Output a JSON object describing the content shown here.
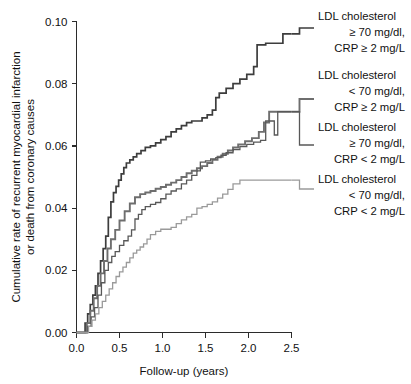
{
  "chart_data": {
    "type": "line",
    "title": "",
    "xlabel": "Follow-up (years)",
    "ylabel": "Cumulative rate of recurrent myocardial infarction or death from coronary causes",
    "ylabel_line1": "Cumulative rate of recurrent myocardial infarction",
    "ylabel_line2": "or death from coronary causes",
    "xlim": [
      0.0,
      2.5
    ],
    "ylim": [
      0.0,
      0.1
    ],
    "xticks": [
      "0.0",
      "0.5",
      "1.0",
      "1.5",
      "2.0",
      "2.5"
    ],
    "xtick_values": [
      0.0,
      0.5,
      1.0,
      1.5,
      2.0,
      2.5
    ],
    "yticks": [
      "0.00",
      "0.02",
      "0.04",
      "0.06",
      "0.08",
      "0.10"
    ],
    "ytick_values": [
      0.0,
      0.02,
      0.04,
      0.06,
      0.08,
      0.1
    ],
    "grid": false,
    "legend_position": "right",
    "step_type": "post",
    "series": [
      {
        "name": "LDL cholesterol >= 70 mg/dl, CRP >= 2 mg/L",
        "label_line1": "LDL cholesterol",
        "label_line2": "≥ 70 mg/dl,",
        "label_line3": "CRP ≥ 2 mg/L",
        "color": "#3d3d3d",
        "width": 1.7,
        "x": [
          0.0,
          0.07,
          0.1,
          0.13,
          0.16,
          0.19,
          0.22,
          0.25,
          0.28,
          0.31,
          0.34,
          0.37,
          0.4,
          0.43,
          0.46,
          0.49,
          0.52,
          0.55,
          0.58,
          0.62,
          0.66,
          0.7,
          0.75,
          0.8,
          0.86,
          0.92,
          0.98,
          1.04,
          1.1,
          1.16,
          1.22,
          1.28,
          1.34,
          1.4,
          1.46,
          1.52,
          1.58,
          1.62,
          1.66,
          1.74,
          1.82,
          1.9,
          1.98,
          2.06,
          2.1,
          2.2,
          2.32,
          2.4,
          2.5
        ],
        "y": [
          0.0,
          0.0,
          0.003,
          0.006,
          0.009,
          0.012,
          0.015,
          0.019,
          0.023,
          0.027,
          0.031,
          0.037,
          0.042,
          0.045,
          0.047,
          0.049,
          0.051,
          0.053,
          0.0545,
          0.0555,
          0.0565,
          0.0575,
          0.0585,
          0.0595,
          0.06,
          0.061,
          0.062,
          0.063,
          0.0645,
          0.0655,
          0.0665,
          0.0675,
          0.068,
          0.068,
          0.069,
          0.07,
          0.0715,
          0.0755,
          0.077,
          0.0785,
          0.08,
          0.0815,
          0.083,
          0.0855,
          0.0925,
          0.093,
          0.093,
          0.096,
          0.096
        ]
      },
      {
        "name": "LDL cholesterol < 70 mg/dl, CRP >= 2 mg/L",
        "label_line1": "LDL cholesterol",
        "label_line2": "< 70 mg/dl,",
        "label_line3": "CRP ≥ 2 mg/L",
        "color": "#6e6e6e",
        "width": 1.9,
        "x": [
          0.0,
          0.08,
          0.12,
          0.16,
          0.2,
          0.24,
          0.28,
          0.32,
          0.36,
          0.4,
          0.45,
          0.5,
          0.56,
          0.62,
          0.68,
          0.74,
          0.8,
          0.86,
          0.92,
          0.98,
          1.04,
          1.1,
          1.16,
          1.22,
          1.28,
          1.34,
          1.4,
          1.46,
          1.52,
          1.58,
          1.64,
          1.7,
          1.76,
          1.82,
          1.88,
          1.96,
          2.04,
          2.12,
          2.18,
          2.24,
          2.3,
          2.38,
          2.5
        ],
        "y": [
          0.0,
          0.0,
          0.003,
          0.007,
          0.011,
          0.015,
          0.019,
          0.023,
          0.027,
          0.03,
          0.033,
          0.036,
          0.039,
          0.0415,
          0.0435,
          0.0445,
          0.045,
          0.0455,
          0.0462,
          0.0468,
          0.0475,
          0.0482,
          0.049,
          0.05,
          0.0512,
          0.052,
          0.0528,
          0.0535,
          0.0545,
          0.0555,
          0.0565,
          0.0575,
          0.0585,
          0.0595,
          0.0605,
          0.0615,
          0.0625,
          0.0645,
          0.0675,
          0.071,
          0.071,
          0.071,
          0.071
        ]
      },
      {
        "name": "LDL cholesterol >= 70 mg/dl, CRP < 2 mg/L",
        "label_line1": "LDL cholesterol",
        "label_line2": "≥ 70 mg/dl,",
        "label_line3": "CRP < 2 mg/L",
        "color": "#585858",
        "width": 1.3,
        "x": [
          0.0,
          0.09,
          0.13,
          0.17,
          0.21,
          0.25,
          0.29,
          0.33,
          0.37,
          0.41,
          0.45,
          0.5,
          0.55,
          0.6,
          0.64,
          0.68,
          0.72,
          0.76,
          0.8,
          0.86,
          0.92,
          0.98,
          1.04,
          1.1,
          1.16,
          1.22,
          1.28,
          1.34,
          1.4,
          1.44,
          1.5,
          1.56,
          1.62,
          1.68,
          1.74,
          1.82,
          1.9,
          1.98,
          2.06,
          2.14,
          2.2,
          2.24,
          2.3,
          2.34,
          2.42,
          2.5
        ],
        "y": [
          0.0,
          0.0,
          0.002,
          0.005,
          0.008,
          0.012,
          0.016,
          0.02,
          0.0225,
          0.0245,
          0.026,
          0.028,
          0.0295,
          0.031,
          0.033,
          0.0365,
          0.038,
          0.0395,
          0.0405,
          0.0412,
          0.0418,
          0.043,
          0.0445,
          0.0455,
          0.0462,
          0.0478,
          0.049,
          0.0505,
          0.052,
          0.0548,
          0.0552,
          0.0558,
          0.0562,
          0.057,
          0.0578,
          0.0588,
          0.0598,
          0.0605,
          0.0612,
          0.0618,
          0.068,
          0.068,
          0.0635,
          0.071,
          0.071,
          0.071
        ]
      },
      {
        "name": "LDL cholesterol < 70 mg/dl, CRP < 2 mg/L",
        "label_line1": "LDL cholesterol",
        "label_line2": "< 70 mg/dl,",
        "label_line3": "CRP < 2 mg/L",
        "color": "#9a9a9a",
        "width": 1.3,
        "x": [
          0.0,
          0.1,
          0.14,
          0.18,
          0.22,
          0.26,
          0.3,
          0.34,
          0.38,
          0.42,
          0.46,
          0.5,
          0.54,
          0.58,
          0.62,
          0.66,
          0.7,
          0.74,
          0.78,
          0.82,
          0.86,
          0.92,
          0.98,
          1.04,
          1.1,
          1.16,
          1.22,
          1.28,
          1.34,
          1.4,
          1.46,
          1.52,
          1.58,
          1.64,
          1.7,
          1.76,
          1.82,
          1.9,
          2.0,
          2.2,
          2.4,
          2.5
        ],
        "y": [
          0.0,
          0.0,
          0.002,
          0.004,
          0.006,
          0.008,
          0.01,
          0.012,
          0.014,
          0.016,
          0.018,
          0.0195,
          0.021,
          0.0225,
          0.024,
          0.0255,
          0.0265,
          0.0275,
          0.0285,
          0.03,
          0.0315,
          0.0325,
          0.0332,
          0.0332,
          0.0338,
          0.035,
          0.0362,
          0.0372,
          0.038,
          0.04,
          0.0405,
          0.0412,
          0.042,
          0.0432,
          0.0445,
          0.046,
          0.0478,
          0.049,
          0.049,
          0.049,
          0.049,
          0.049
        ]
      }
    ]
  },
  "legend": {
    "entries": [
      {
        "line1": "LDL cholesterol",
        "line2": "≥ 70 mg/dl,",
        "line3": "CRP ≥ 2 mg/L"
      },
      {
        "line1": "LDL cholesterol",
        "line2": "< 70 mg/dl,",
        "line3": "CRP ≥ 2 mg/L"
      },
      {
        "line1": "LDL cholesterol",
        "line2": "≥ 70 mg/dl,",
        "line3": "CRP < 2 mg/L"
      },
      {
        "line1": "LDL cholesterol",
        "line2": "< 70 mg/dl,",
        "line3": "CRP < 2 mg/L"
      }
    ]
  },
  "axes": {
    "x_title": "Follow-up (years)",
    "y_title_line1": "Cumulative rate of recurrent myocardial infarction",
    "y_title_line2": "or death from coronary causes",
    "x_tick_labels": [
      "0.0",
      "0.5",
      "1.0",
      "1.5",
      "2.0",
      "2.5"
    ],
    "y_tick_labels": [
      "0.00",
      "0.02",
      "0.04",
      "0.06",
      "0.08",
      "0.10"
    ]
  }
}
